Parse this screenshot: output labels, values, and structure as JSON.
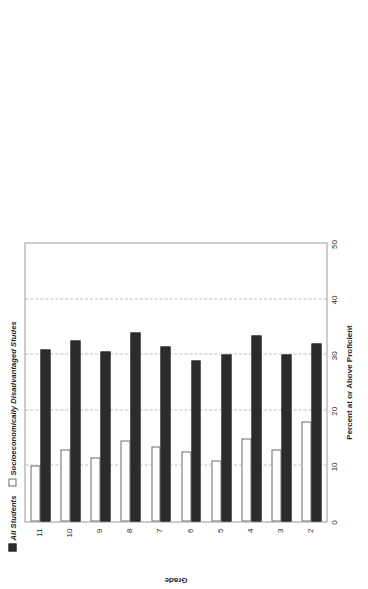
{
  "chart_data": {
    "type": "bar",
    "orientation": "horizontal",
    "title": "",
    "xlabel": "Grade",
    "ylabel": "Percent at or Above Proficient",
    "categories": [
      "2",
      "3",
      "4",
      "5",
      "6",
      "7",
      "8",
      "9",
      "10",
      "11"
    ],
    "category_axis_label": "Grade",
    "value_axis_label": "Percent at or Above Proficient",
    "ylim": [
      0,
      50
    ],
    "value_ticks": [
      "0",
      "10",
      "20",
      "30",
      "40",
      "50"
    ],
    "value_tick_values": [
      0,
      10,
      20,
      30,
      40,
      50
    ],
    "grid": "dashed gridlines at 10, 20, 30, 40",
    "gridline_values": [
      10,
      20,
      30,
      40
    ],
    "legend_position": "top-left",
    "series": [
      {
        "name": "All Students",
        "marker": "filled-square",
        "color": "#2b2b2b",
        "values": [
          32,
          30,
          33.5,
          30,
          29,
          31.5,
          34,
          30.5,
          32.5,
          31
        ]
      },
      {
        "name": "Socioeconomically Disadvantaged Studes",
        "marker": "open-square",
        "color": "#ffffff",
        "values": [
          18,
          13,
          15,
          11,
          12.5,
          13.5,
          14.5,
          11.5,
          13,
          10
        ]
      }
    ]
  },
  "legend": {
    "item1_label": "All Students",
    "item2_label": "Socioeconomically Disadvantaged Studes"
  }
}
